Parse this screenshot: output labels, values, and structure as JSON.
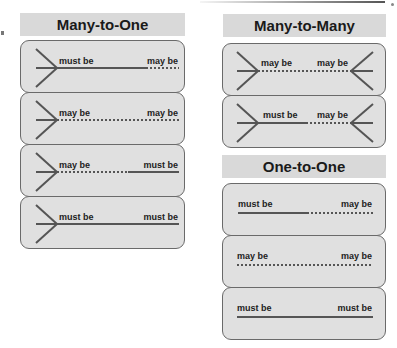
{
  "columns": [
    {
      "title": "Many-to-One",
      "rows": [
        {
          "left_label": "must be",
          "right_label": "may be",
          "left_style": "solid",
          "right_style": "dotted",
          "left_crowfoot": true,
          "right_crowfoot": false
        },
        {
          "left_label": "may be",
          "right_label": "may be",
          "left_style": "dotted",
          "right_style": "dotted",
          "left_crowfoot": true,
          "right_crowfoot": false
        },
        {
          "left_label": "may be",
          "right_label": "must be",
          "left_style": "dotted",
          "right_style": "solid",
          "left_crowfoot": true,
          "right_crowfoot": false
        },
        {
          "left_label": "must be",
          "right_label": "must be",
          "left_style": "solid",
          "right_style": "solid",
          "left_crowfoot": true,
          "right_crowfoot": false
        }
      ]
    },
    {
      "title": "Many-to-Many",
      "rows": [
        {
          "left_label": "may be",
          "right_label": "may be",
          "left_style": "dotted",
          "right_style": "dotted",
          "left_crowfoot": true,
          "right_crowfoot": true
        },
        {
          "left_label": "must be",
          "right_label": "may be",
          "left_style": "solid",
          "right_style": "dotted",
          "left_crowfoot": true,
          "right_crowfoot": true
        }
      ]
    },
    {
      "title": "One-to-One",
      "rows": [
        {
          "left_label": "must be",
          "right_label": "may be",
          "left_style": "solid",
          "right_style": "dotted",
          "left_crowfoot": false,
          "right_crowfoot": false
        },
        {
          "left_label": "may be",
          "right_label": "may be",
          "left_style": "dotted",
          "right_style": "dotted",
          "left_crowfoot": false,
          "right_crowfoot": false
        },
        {
          "left_label": "must be",
          "right_label": "must be",
          "left_style": "solid",
          "right_style": "solid",
          "left_crowfoot": false,
          "right_crowfoot": false
        }
      ]
    }
  ],
  "colors": {
    "header_bg": "#d9d9d9",
    "box_bg": "#e0e0e0",
    "line": "#555555",
    "text": "#222222"
  }
}
